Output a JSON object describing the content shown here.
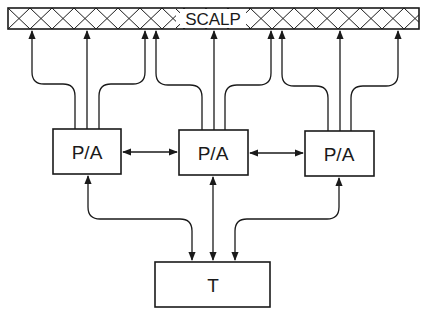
{
  "diagram": {
    "scalp": {
      "label": "SCALP"
    },
    "processors": [
      {
        "label": "P/A"
      },
      {
        "label": "P/A"
      },
      {
        "label": "P/A"
      }
    ],
    "terminal": {
      "label": "T"
    },
    "colors": {
      "line": "#1a1a1a",
      "background": "#ffffff"
    }
  }
}
